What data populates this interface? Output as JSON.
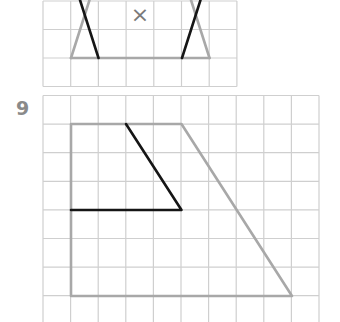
{
  "colors": {
    "grid": "#cfcfcf",
    "shape_grey": "#a8a8a8",
    "shape_black": "#151515",
    "cross": "#7a7a7a",
    "label": "#8a8a8a",
    "background": "#ffffff"
  },
  "exercise_top": {
    "mark_icon": "cross-icon",
    "mark_text": "×",
    "grid": {
      "x0": 43,
      "y0": 1,
      "cell_w": 27.7,
      "cell_h": 28.5,
      "cols": 7,
      "rows": 3
    },
    "grey_lines": [
      [
        [
          71,
          58
        ],
        [
          89.5,
          0
        ]
      ],
      [
        [
          71,
          58
        ],
        [
          209.5,
          58
        ]
      ],
      [
        [
          209.5,
          58
        ],
        [
          191,
          0
        ]
      ]
    ],
    "black_lines": [
      [
        [
          98.5,
          58
        ],
        [
          80,
          0
        ]
      ],
      [
        [
          182,
          58
        ],
        [
          200.5,
          0
        ]
      ]
    ],
    "mark_pos": [
      140,
      14
    ]
  },
  "exercise_bottom": {
    "number": "9",
    "grid": {
      "x0": 43,
      "y0": 95.5,
      "cell_w": 27.6,
      "cell_h": 28.6,
      "cols": 10,
      "rows": 8
    },
    "grey_shape": [
      [
        71,
        124
      ],
      [
        181.5,
        124
      ],
      [
        292,
        296
      ],
      [
        71,
        296
      ]
    ],
    "black_path": [
      [
        126,
        124
      ],
      [
        181.5,
        210
      ],
      [
        71,
        210
      ]
    ]
  }
}
